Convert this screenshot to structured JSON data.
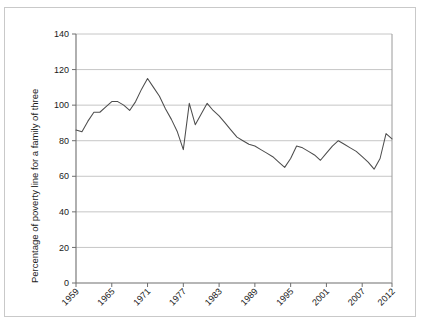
{
  "chart_data": {
    "type": "line",
    "title": "",
    "xlabel": "",
    "ylabel": "Percentage of poverty line for a family of three",
    "xlim": [
      1959,
      2012
    ],
    "ylim": [
      0,
      140
    ],
    "grid": true,
    "legend": "none",
    "y_ticks": [
      0,
      20,
      40,
      60,
      80,
      100,
      120,
      140
    ],
    "x_ticks": [
      1959,
      1965,
      1971,
      1977,
      1983,
      1989,
      1995,
      2001,
      2007,
      2012
    ],
    "x_tick_labels": [
      "1959",
      "1965",
      "1971",
      "1977",
      "1983",
      "1989",
      "1995",
      "2001",
      "2007",
      "2012"
    ],
    "y_tick_labels": [
      "0",
      "20",
      "40",
      "60",
      "80",
      "100",
      "120",
      "140"
    ],
    "series": [
      {
        "name": "Percentage of poverty line for a family of three",
        "color": "#4d4d4d",
        "x": [
          1959,
          1960,
          1961,
          1962,
          1963,
          1964,
          1965,
          1966,
          1967,
          1968,
          1969,
          1970,
          1971,
          1972,
          1973,
          1974,
          1975,
          1976,
          1977,
          1978,
          1979,
          1980,
          1981,
          1982,
          1983,
          1984,
          1985,
          1986,
          1987,
          1988,
          1989,
          1990,
          1991,
          1992,
          1993,
          1994,
          1995,
          1996,
          1997,
          1998,
          1999,
          2000,
          2001,
          2002,
          2003,
          2004,
          2005,
          2006,
          2007,
          2008,
          2009,
          2010,
          2011,
          2012
        ],
        "values": [
          86,
          85,
          91,
          96,
          96,
          99,
          102,
          102,
          100,
          97,
          102,
          109,
          115,
          110,
          105,
          98,
          92,
          85,
          75,
          101,
          89,
          95,
          101,
          97,
          94,
          90,
          86,
          82,
          80,
          78,
          77,
          75,
          73,
          71,
          68,
          65,
          70,
          77,
          76,
          74,
          72,
          69,
          73,
          77,
          80,
          78,
          76,
          74,
          71,
          68,
          64,
          70,
          84,
          81
        ]
      }
    ],
    "annotations": []
  }
}
